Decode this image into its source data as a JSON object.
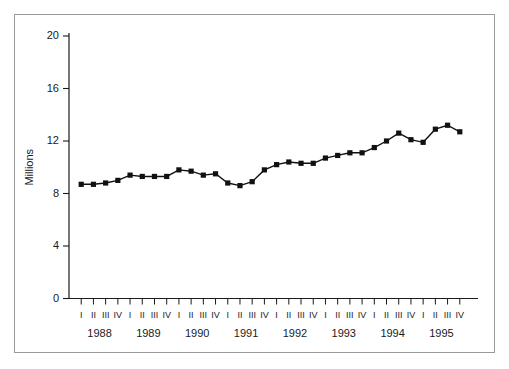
{
  "figure": {
    "frame_color": "#9a9a9a",
    "background": "#ffffff"
  },
  "chart_data": {
    "type": "line",
    "title": "",
    "subtitle": "",
    "xlabel": "",
    "ylabel": "Millions",
    "ylim": [
      0,
      20
    ],
    "yticks": [
      0,
      4,
      8,
      12,
      16,
      20
    ],
    "ytick_labels": [
      "0",
      "4",
      "8",
      "12",
      "16",
      "20"
    ],
    "grid": false,
    "legend": null,
    "legend_position": "none",
    "marker": "square",
    "line_color": "#111111",
    "marker_color": "#111111",
    "years": [
      "1988",
      "1989",
      "1990",
      "1991",
      "1992",
      "1993",
      "1994",
      "1995"
    ],
    "quarters": [
      "I",
      "II",
      "III",
      "IV"
    ],
    "x": [
      "1988 I",
      "1988 II",
      "1988 III",
      "1988 IV",
      "1989 I",
      "1989 II",
      "1989 III",
      "1989 IV",
      "1990 I",
      "1990 II",
      "1990 III",
      "1990 IV",
      "1991 I",
      "1991 II",
      "1991 III",
      "1991 IV",
      "1992 I",
      "1992 II",
      "1992 III",
      "1992 IV",
      "1993 I",
      "1993 II",
      "1993 III",
      "1993 IV",
      "1994 I",
      "1994 II",
      "1994 III",
      "1994 IV",
      "1995 I",
      "1995 II",
      "1995 III",
      "1995 IV"
    ],
    "values": [
      8.7,
      8.7,
      8.8,
      9.0,
      9.4,
      9.3,
      9.3,
      9.3,
      9.8,
      9.7,
      9.4,
      9.5,
      8.8,
      8.6,
      8.9,
      9.8,
      10.2,
      10.4,
      10.3,
      10.3,
      10.7,
      10.9,
      11.1,
      11.1,
      11.5,
      12.0,
      12.6,
      12.1,
      11.9,
      12.9,
      13.2,
      12.7
    ],
    "series": [
      {
        "name": "Millions",
        "values": [
          8.7,
          8.7,
          8.8,
          9.0,
          9.4,
          9.3,
          9.3,
          9.3,
          9.8,
          9.7,
          9.4,
          9.5,
          8.8,
          8.6,
          8.9,
          9.8,
          10.2,
          10.4,
          10.3,
          10.3,
          10.7,
          10.9,
          11.1,
          11.1,
          11.5,
          12.0,
          12.6,
          12.1,
          11.9,
          12.9,
          13.2,
          12.7
        ]
      }
    ]
  }
}
